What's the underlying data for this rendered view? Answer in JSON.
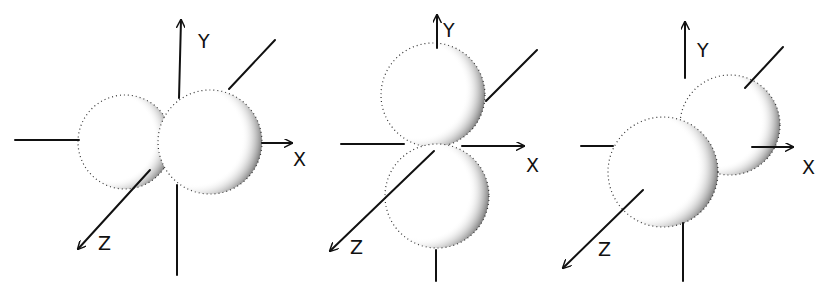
{
  "figure": {
    "colors": {
      "ink": "#111111",
      "background": "#ffffff"
    },
    "panels": [
      {
        "id": "px",
        "orientation": "x",
        "axis_labels": {
          "y": "Y",
          "x": "X",
          "z": "Z"
        },
        "lobes": [
          {
            "cx": 125,
            "cy": 142,
            "r": 47
          },
          {
            "cx": 210,
            "cy": 142,
            "r": 52
          }
        ]
      },
      {
        "id": "py",
        "orientation": "y",
        "axis_labels": {
          "y": "Y",
          "x": "X",
          "z": "Z"
        },
        "lobes": [
          {
            "cx": 433,
            "cy": 95,
            "r": 52
          },
          {
            "cx": 437,
            "cy": 196,
            "r": 52
          }
        ]
      },
      {
        "id": "pz",
        "orientation": "z",
        "axis_labels": {
          "y": "Y",
          "x": "X",
          "z": "Z"
        },
        "lobes": [
          {
            "cx": 730,
            "cy": 125,
            "r": 50
          },
          {
            "cx": 663,
            "cy": 172,
            "r": 55
          }
        ]
      }
    ]
  }
}
